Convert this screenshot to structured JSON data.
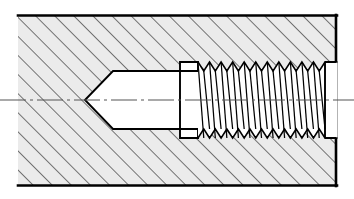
{
  "drawing": {
    "title": "Sectional view of a tapped blind hole",
    "subject": "internal-thread-section",
    "view_type": "full-section",
    "units": "px",
    "canvas": {
      "width": 354,
      "height": 199
    },
    "colors": {
      "line": "#000000",
      "hatch": "#1a1a1a",
      "section_fill": "#ebebeb",
      "void_fill": "#ffffff",
      "centerline": "#555555",
      "background": "#ffffff"
    },
    "line_weights": {
      "outline": 2.6,
      "visible_edge": 1.8,
      "thread_profile": 1.3,
      "hatch": 1.0,
      "centerline": 1.0
    },
    "body": {
      "label": "Sectioned workpiece body",
      "left": 18,
      "right": 337,
      "top": 15,
      "bottom": 186,
      "left_edge_open": true,
      "hatch_angle_deg": 45,
      "hatch_spacing": 13.5
    },
    "axis": {
      "label": "Centreline (axis of revolution)",
      "y": 100,
      "x_start": 0,
      "x_end": 354,
      "style": "chain-dash-dot",
      "dash_pattern": "26 4 3 4"
    },
    "features": [
      {
        "id": "drill-point",
        "label": "Conical drill point (118 deg)",
        "apex_x": 85,
        "base_x": 113,
        "half_width": 29,
        "included_angle_deg": 118
      },
      {
        "id": "minor-bore",
        "label": "Cylindrical bore at minor diameter",
        "x_start": 113,
        "x_end": 180,
        "half_width": 29,
        "diameter_px": 58
      },
      {
        "id": "thread-relief",
        "label": "Thread relief / undercut groove",
        "x_start": 180,
        "x_end": 198,
        "half_width": 38
      },
      {
        "id": "threaded-section",
        "label": "Internal V-thread (tapped)",
        "x_start": 198,
        "x_end": 325,
        "major_half_width": 38,
        "minor_half_width": 29,
        "tooth_count": 11,
        "pitch": 11.5,
        "thread_angle_deg": 60,
        "hand": "right"
      },
      {
        "id": "mouth-counterbore",
        "label": "Hole mouth / entry counterbore",
        "x_start": 325,
        "x_end": 337,
        "half_width": 38
      }
    ]
  }
}
